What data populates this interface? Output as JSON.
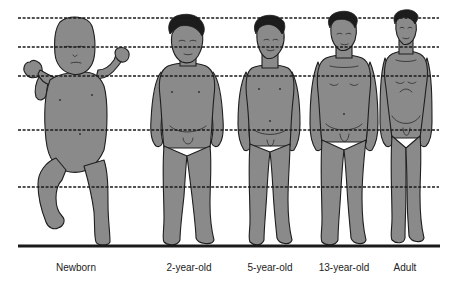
{
  "diagram": {
    "figures": [
      {
        "id": "newborn",
        "label": "Newborn",
        "center_x": 76
      },
      {
        "id": "two-year",
        "label": "2-year-old",
        "center_x": 189
      },
      {
        "id": "five-year",
        "label": "5-year-old",
        "center_x": 270
      },
      {
        "id": "thirteen-year",
        "label": "13-year-old",
        "center_x": 344
      },
      {
        "id": "adult",
        "label": "Adult",
        "center_x": 405
      }
    ],
    "guide_lines": {
      "style": "dashed",
      "count": 5,
      "y_positions": [
        18,
        47,
        76,
        130,
        187
      ],
      "x_start": 18,
      "x_end": 439
    },
    "baseline": {
      "style": "solid",
      "y": 246,
      "x_start": 18,
      "x_end": 440
    },
    "colors": {
      "figure_fill": "#8a8a8a",
      "outline": "#1e1e1e",
      "hair": "#1c1c1c",
      "lines": "#1a1a1a",
      "background": "#ffffff",
      "label_text": "#222222"
    }
  }
}
